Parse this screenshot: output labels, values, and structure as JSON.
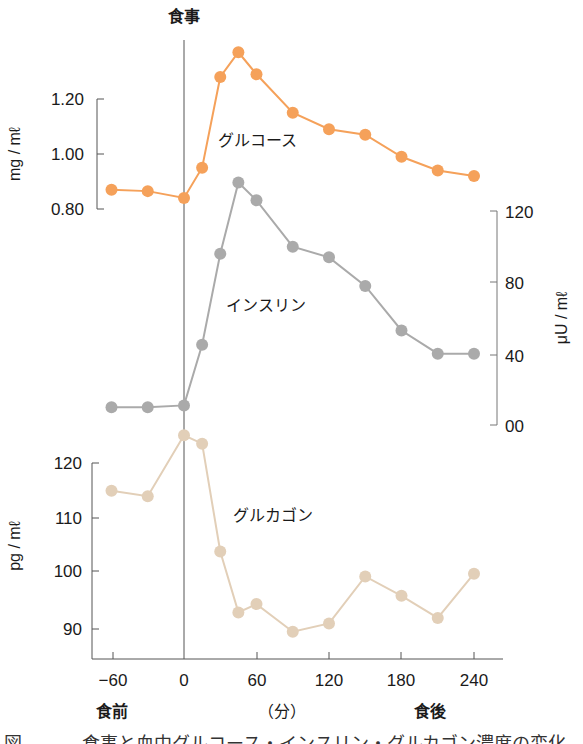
{
  "meal_marker_label": "食事",
  "x_axis": {
    "ticks": [
      "−60",
      "0",
      "60",
      "120",
      "180",
      "240"
    ],
    "unit": "（分）",
    "before_label": "食前",
    "after_label": "食後"
  },
  "glucose_axis": {
    "unit": "mg / mℓ",
    "ticks": [
      "1.20",
      "1.00",
      "0.80"
    ]
  },
  "insulin_axis": {
    "unit": "μU / mℓ",
    "ticks": [
      "120",
      "80",
      "40",
      "00"
    ]
  },
  "glucagon_axis": {
    "unit": "pg / mℓ",
    "ticks": [
      "120",
      "110",
      "100",
      "90"
    ]
  },
  "series_labels": {
    "glucose": "グルコース",
    "insulin": "インスリン",
    "glucagon": "グルカゴン"
  },
  "colors": {
    "glucose": "#F5A15A",
    "insulin": "#AAAAAA",
    "glucagon": "#E2CFB8",
    "axis": "#555555"
  },
  "caption_partial": "図 ……　食事と血中グルコース・インスリン・グルカゴン濃度の変化",
  "chart_data": {
    "type": "line",
    "title": "",
    "xlabel": "（分）",
    "x": [
      -60,
      -30,
      0,
      15,
      30,
      45,
      60,
      90,
      120,
      150,
      180,
      210,
      240
    ],
    "x_ticks": [
      -60,
      0,
      60,
      120,
      180,
      240
    ],
    "annotations": [
      "食事 (vertical line at x=0)",
      "食前 (before meal)",
      "食後 (after meal)"
    ],
    "grid": false,
    "legend": "inline labels",
    "series": [
      {
        "name": "グルコース",
        "unit": "mg/mℓ",
        "axis": "left-top",
        "ylim": [
          0.8,
          1.2
        ],
        "values": [
          0.87,
          0.865,
          0.84,
          0.95,
          1.28,
          1.37,
          1.29,
          1.15,
          1.09,
          1.07,
          0.99,
          0.94,
          0.92
        ]
      },
      {
        "name": "インスリン",
        "unit": "μU/mℓ",
        "axis": "right-middle",
        "ylim": [
          0,
          120
        ],
        "values": [
          10,
          10,
          11,
          45,
          96,
          136,
          126,
          100,
          94,
          78,
          53,
          40,
          40
        ]
      },
      {
        "name": "グルカゴン",
        "unit": "pg/mℓ",
        "axis": "left-bottom",
        "ylim": [
          90,
          120
        ],
        "values": [
          115,
          114,
          125,
          123.5,
          104,
          93,
          94.5,
          89.5,
          91,
          99.5,
          96,
          92,
          100
        ]
      }
    ]
  }
}
